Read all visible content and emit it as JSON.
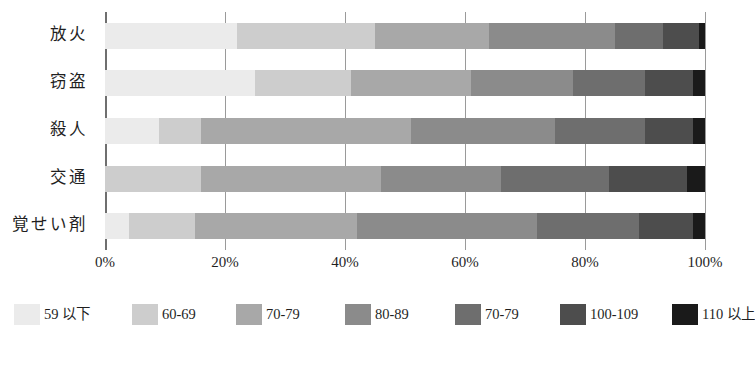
{
  "chart_data": {
    "type": "bar",
    "orientation": "horizontal",
    "stacked": true,
    "normalized_percent": true,
    "title": "",
    "xlabel": "",
    "ylabel": "",
    "xlim": [
      0,
      100
    ],
    "grid": true,
    "legend_position": "bottom",
    "categories": [
      "放火",
      "窃盗",
      "殺人",
      "交通",
      "覚せい剤"
    ],
    "xticks": [
      0,
      20,
      40,
      60,
      80,
      100
    ],
    "xtick_labels": [
      "0%",
      "20%",
      "40%",
      "60%",
      "80%",
      "100%"
    ],
    "series": [
      {
        "name": "59 以下",
        "color": "#ebebeb",
        "values": [
          22,
          25,
          9,
          0,
          4
        ]
      },
      {
        "name": "60-69",
        "color": "#cdcdcd",
        "values": [
          23,
          16,
          7,
          16,
          11
        ]
      },
      {
        "name": "70-79",
        "color": "#a8a8a8",
        "values": [
          19,
          20,
          35,
          30,
          27
        ]
      },
      {
        "name": "80-89",
        "color": "#8b8b8b",
        "values": [
          21,
          17,
          24,
          20,
          30
        ]
      },
      {
        "name": "70-79",
        "color": "#6e6e6e",
        "values": [
          8,
          12,
          15,
          18,
          17
        ]
      },
      {
        "name": "100-109",
        "color": "#4d4d4d",
        "values": [
          6,
          8,
          8,
          13,
          9
        ]
      },
      {
        "name": "110 以上",
        "color": "#1a1a1a",
        "values": [
          1,
          2,
          2,
          3,
          2
        ]
      }
    ]
  },
  "axis": {
    "y_category_labels": [
      "放火",
      "窃盗",
      "殺人",
      "交通",
      "覚せい剤"
    ],
    "x_tick_labels": [
      "0%",
      "20%",
      "40%",
      "60%",
      "80%",
      "100%"
    ]
  },
  "legend": {
    "items": [
      {
        "label": "59 以下",
        "color": "#ebebeb"
      },
      {
        "label": "60-69",
        "color": "#cdcdcd"
      },
      {
        "label": "70-79",
        "color": "#a8a8a8"
      },
      {
        "label": "80-89",
        "color": "#8b8b8b"
      },
      {
        "label": "70-79",
        "color": "#6e6e6e"
      },
      {
        "label": "100-109",
        "color": "#4d4d4d"
      },
      {
        "label": "110 以上",
        "color": "#1a1a1a"
      }
    ]
  },
  "colors": {
    "axis": "#6f6f6f",
    "gridline": "#9a9a9a",
    "text": "#1f1f1f",
    "background": "#ffffff"
  }
}
